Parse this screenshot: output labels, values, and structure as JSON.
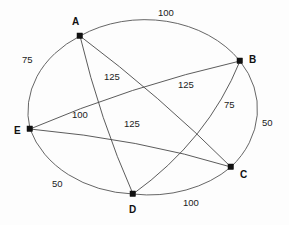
{
  "diagram": {
    "background_color": "#fdfdfd",
    "edge_color": "#4a4a4a",
    "node_color": "#111111",
    "label_color": "#111111"
  },
  "nodes": [
    {
      "id": "A",
      "label": "A",
      "x": 80,
      "y": 36,
      "label_x": 72,
      "label_y": 17
    },
    {
      "id": "B",
      "label": "B",
      "x": 240,
      "y": 61,
      "label_x": 249,
      "label_y": 55
    },
    {
      "id": "C",
      "label": "C",
      "x": 231,
      "y": 167,
      "label_x": 240,
      "label_y": 170
    },
    {
      "id": "D",
      "label": "D",
      "x": 133,
      "y": 194,
      "label_x": 129,
      "label_y": 205
    },
    {
      "id": "E",
      "label": "E",
      "x": 30,
      "y": 129,
      "label_x": 14,
      "label_y": 126
    }
  ],
  "edges": [
    {
      "from": "A",
      "to": "B",
      "weight": "100",
      "kind": "outer",
      "label_x": 158,
      "label_y": 8
    },
    {
      "from": "A",
      "to": "E",
      "weight": "75",
      "kind": "outer",
      "label_x": 22,
      "label_y": 55
    },
    {
      "from": "B",
      "to": "C",
      "weight": "50",
      "kind": "outer",
      "label_x": 262,
      "label_y": 118
    },
    {
      "from": "C",
      "to": "D",
      "weight": "100",
      "kind": "outer",
      "label_x": 183,
      "label_y": 198
    },
    {
      "from": "D",
      "to": "E",
      "weight": "50",
      "kind": "outer",
      "label_x": 52,
      "label_y": 179
    },
    {
      "from": "A",
      "to": "C",
      "weight": "125",
      "kind": "chord",
      "label_x": 178,
      "label_y": 80
    },
    {
      "from": "B",
      "to": "E",
      "weight": "125",
      "kind": "chord",
      "label_x": 104,
      "label_y": 72
    },
    {
      "from": "B",
      "to": "D",
      "weight": "75",
      "kind": "chord",
      "label_x": 224,
      "label_y": 100
    },
    {
      "from": "A",
      "to": "D",
      "weight": "100",
      "kind": "chord",
      "label_x": 72,
      "label_y": 110
    },
    {
      "from": "C",
      "to": "E",
      "weight": "125",
      "kind": "chord",
      "label_x": 124,
      "label_y": 119
    }
  ],
  "ellipse": {
    "cx": 133,
    "cy": 115,
    "rx": 113,
    "ry": 90
  }
}
